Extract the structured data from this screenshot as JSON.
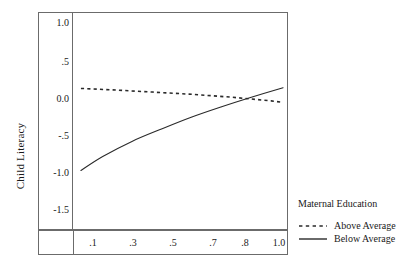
{
  "chart_data": {
    "type": "line",
    "title": "",
    "xlabel": "",
    "ylabel": "Child Literacy",
    "xlim": [
      0.0,
      1.08
    ],
    "ylim": [
      -1.75,
      1.2
    ],
    "grid": false,
    "legend_position": "right",
    "legend_title": "Maternal Education",
    "xticks": [
      ".1",
      ".3",
      ".5",
      ".7",
      ".8",
      "1.0"
    ],
    "xtick_values": [
      0.1,
      0.3,
      0.5,
      0.7,
      0.8,
      1.0
    ],
    "yticks": [
      "1.0",
      ".5",
      "0.0",
      "-.5",
      "-1.0",
      "-1.5"
    ],
    "ytick_values": [
      1.0,
      0.5,
      0.0,
      -0.5,
      -1.0,
      -1.5
    ],
    "series": [
      {
        "name": "Above Average",
        "style": "dashed",
        "color": "#2a2a2a",
        "x": [
          0.04,
          0.2,
          0.4,
          0.6,
          0.8,
          1.0,
          1.06
        ],
        "values": [
          0.17,
          0.15,
          0.12,
          0.09,
          0.05,
          0.0,
          -0.02
        ]
      },
      {
        "name": "Below Average",
        "style": "solid",
        "color": "#2a2a2a",
        "x": [
          0.04,
          0.15,
          0.3,
          0.45,
          0.6,
          0.75,
          0.9,
          1.06
        ],
        "values": [
          -0.95,
          -0.76,
          -0.55,
          -0.38,
          -0.22,
          -0.08,
          0.05,
          0.18
        ]
      }
    ],
    "annotations": []
  },
  "axes": {
    "y_title": "Child Literacy",
    "y_labels": [
      "1.0",
      ".5",
      "0.0",
      "-.5",
      "-1.0",
      "-1.5"
    ],
    "x_labels": [
      ".1",
      ".3",
      ".5",
      ".7",
      ".8",
      "1.0"
    ]
  },
  "legend": {
    "title": "Maternal Education",
    "entries": [
      {
        "label": "Above Average",
        "style": "dashed"
      },
      {
        "label": "Below Average",
        "style": "solid"
      }
    ]
  },
  "colors": {
    "line": "#2a2a2a",
    "frame": "#6b6b6b",
    "text": "#1a1a1a",
    "background": "#ffffff"
  }
}
